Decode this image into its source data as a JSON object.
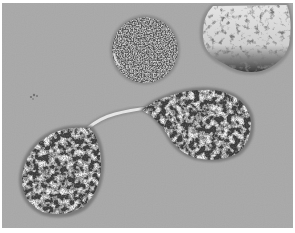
{
  "image": {
    "kind": "grayscale electron micrograph",
    "colors": {
      "background": "#a8a8a8",
      "border": "#ffffff",
      "cell_dark": "#2e2e2e",
      "cell_light": "#e8e8e8"
    },
    "objects": [
      {
        "name": "round-cell",
        "shape": "circle",
        "cx": 145,
        "cy": 50,
        "r": 33,
        "texture": "fine dark granular"
      },
      {
        "name": "partial-cell-top-right",
        "shape": "blob",
        "bbox": [
          198,
          2,
          293,
          78
        ],
        "texture": "light with dark patches"
      },
      {
        "name": "teardrop-cell-lower-left",
        "shape": "teardrop",
        "bbox": [
          18,
          120,
          105,
          220
        ],
        "texture": "mottled dark"
      },
      {
        "name": "teardrop-cell-right",
        "shape": "teardrop",
        "bbox": [
          140,
          87,
          255,
          165
        ],
        "texture": "mottled dark"
      },
      {
        "name": "cytoplasmic-bridge",
        "shape": "thin strand",
        "from": [
          92,
          125
        ],
        "to": [
          150,
          108
        ]
      },
      {
        "name": "small-speckle",
        "shape": "dots",
        "cx": 34,
        "cy": 96
      }
    ]
  }
}
